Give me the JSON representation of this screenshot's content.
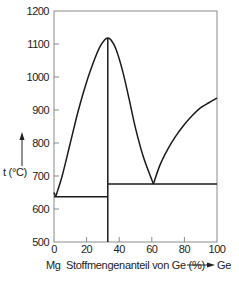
{
  "chart_data": {
    "type": "line",
    "title": "",
    "xlabel": "Stoffmengenanteil von Ge (%)",
    "xlabel_left_element": "Mg",
    "xlabel_right_element": "Ge",
    "ylabel": "t (°C)",
    "xlim": [
      0,
      100
    ],
    "ylim": [
      500,
      1200
    ],
    "x_ticks": [
      0,
      20,
      40,
      60,
      80,
      100
    ],
    "x_tick_labels": [
      "0",
      "20",
      "40",
      "60",
      "80",
      "100"
    ],
    "y_ticks": [
      500,
      600,
      700,
      800,
      900,
      1000,
      1100,
      1200
    ],
    "y_tick_labels": [
      "500",
      "600",
      "700",
      "800",
      "900",
      "1000",
      "1100",
      "1200"
    ],
    "grid": false,
    "series": [
      {
        "name": "liquidus-left",
        "x": [
          0,
          1
        ],
        "y": [
          650,
          637
        ]
      },
      {
        "name": "liquidus-compound",
        "x": [
          1,
          5,
          10,
          15,
          20,
          25,
          28,
          31,
          33,
          35,
          38,
          42,
          46,
          50,
          55,
          61
        ],
        "y": [
          637,
          700,
          800,
          900,
          985,
          1055,
          1090,
          1112,
          1118,
          1112,
          1085,
          1020,
          935,
          845,
          755,
          676
        ]
      },
      {
        "name": "liquidus-right",
        "x": [
          61,
          65,
          70,
          75,
          80,
          85,
          90,
          95,
          100
        ],
        "y": [
          676,
          733,
          783,
          823,
          856,
          884,
          907,
          922,
          936
        ]
      },
      {
        "name": "eutectic-left",
        "x": [
          0,
          33
        ],
        "y": [
          637,
          637
        ]
      },
      {
        "name": "eutectic-right",
        "x": [
          33,
          100
        ],
        "y": [
          676,
          676
        ]
      },
      {
        "name": "compound-line",
        "x": [
          33,
          33
        ],
        "y": [
          500,
          1118
        ]
      }
    ]
  }
}
